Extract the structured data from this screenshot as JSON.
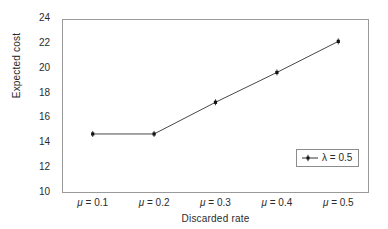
{
  "chart_data": {
    "type": "line",
    "title": "",
    "xlabel": "Discarded rate",
    "ylabel": "Expected cost",
    "categories": [
      "μ = 0.1",
      "μ = 0.2",
      "μ = 0.3",
      "μ = 0.4",
      "μ = 0.5"
    ],
    "series": [
      {
        "name": "λ = 0.5",
        "values": [
          14.75,
          14.75,
          17.3,
          19.7,
          22.2
        ],
        "color": "#333333",
        "marker": "plus-dot"
      }
    ],
    "ylim": [
      10,
      24
    ],
    "yticks": [
      10,
      12,
      14,
      16,
      18,
      20,
      22,
      24
    ],
    "ytick_labels": [
      "10",
      "12",
      "14",
      "16",
      "18",
      "20",
      "22",
      "24"
    ],
    "grid": false,
    "legend_position": "lower-right",
    "legend_entries": [
      "λ = 0.5"
    ],
    "frame": true
  },
  "axes": {
    "y_title": "Expected cost",
    "x_title": "Discarded rate"
  },
  "legend": {
    "label": "λ = 0.5"
  }
}
